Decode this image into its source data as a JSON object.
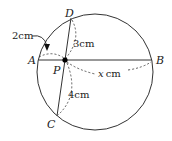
{
  "diagram": {
    "points": {
      "A": "A",
      "B": "B",
      "C": "C",
      "D": "D",
      "P": "P"
    },
    "measurements": {
      "PA": "2cm",
      "PD": "3cm",
      "PC": "4cm",
      "PB_var": "x",
      "PB_unit": "cm"
    },
    "colors": {
      "stroke": "#333333",
      "point": "#000000"
    }
  }
}
